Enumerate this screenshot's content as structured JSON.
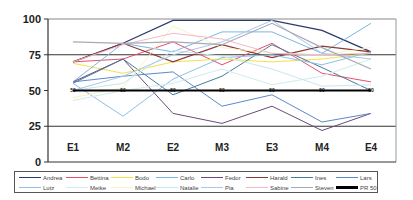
{
  "chart_data": {
    "type": "line",
    "title": "",
    "xlabel": "",
    "ylabel": "",
    "ylim": [
      0,
      100
    ],
    "yticks": [
      0,
      25,
      50,
      75,
      100
    ],
    "grid": {
      "horizontal_at": [
        25,
        75,
        100
      ],
      "vertical": false
    },
    "legend_position": "bottom",
    "categories": [
      "E1",
      "M2",
      "E2",
      "M3",
      "E3",
      "M4",
      "E4"
    ],
    "series": [
      {
        "name": "Andrea",
        "color": "#2b3a6b",
        "width": 1.2,
        "values": [
          70,
          83,
          99,
          99,
          99,
          92,
          77
        ]
      },
      {
        "name": "Bettina",
        "color": "#e8506a",
        "width": 1.0,
        "values": [
          70,
          72,
          84,
          68,
          83,
          62,
          56
        ]
      },
      {
        "name": "Bodo",
        "color": "#f2e24a",
        "width": 1.0,
        "values": [
          69,
          62,
          70,
          72,
          70,
          72,
          76
        ]
      },
      {
        "name": "Carlo",
        "color": "#7ab8e0",
        "width": 1.0,
        "values": [
          56,
          83,
          77,
          91,
          91,
          76,
          97
        ]
      },
      {
        "name": "Fedor",
        "color": "#6b4a7a",
        "width": 1.0,
        "values": [
          56,
          72,
          34,
          27,
          39,
          22,
          34
        ]
      },
      {
        "name": "Harald",
        "color": "#8a3a3a",
        "width": 1.2,
        "values": [
          70,
          83,
          70,
          82,
          73,
          81,
          77
        ]
      },
      {
        "name": "Ines",
        "color": "#4a7a9a",
        "width": 1.0,
        "values": [
          55,
          72,
          47,
          60,
          82,
          66,
          50
        ]
      },
      {
        "name": "Lars",
        "color": "#5b8ac8",
        "width": 1.0,
        "values": [
          56,
          60,
          63,
          39,
          47,
          28,
          34
        ]
      },
      {
        "name": "Lutz",
        "color": "#8fc0e8",
        "width": 1.0,
        "values": [
          55,
          32,
          58,
          73,
          75,
          68,
          77
        ]
      },
      {
        "name": "Meike",
        "color": "#d0ecf0",
        "width": 1.0,
        "values": [
          43,
          50,
          55,
          65,
          54,
          60,
          72
        ]
      },
      {
        "name": "Michael",
        "color": "#f7f2c0",
        "width": 1.0,
        "values": [
          45,
          52,
          95,
          80,
          76,
          75,
          80
        ]
      },
      {
        "name": "Natalie",
        "color": "#c8e8ec",
        "width": 1.0,
        "values": [
          50,
          55,
          78,
          74,
          65,
          53,
          54
        ]
      },
      {
        "name": "Pia",
        "color": "#a8c8e8",
        "width": 1.0,
        "values": [
          50,
          60,
          75,
          84,
          99,
          76,
          72
        ]
      },
      {
        "name": "Sabine",
        "color": "#f4b8c8",
        "width": 1.0,
        "values": [
          70,
          82,
          90,
          86,
          76,
          75,
          76
        ]
      },
      {
        "name": "Steven",
        "color": "#a8a8b8",
        "width": 1.2,
        "values": [
          84,
          83,
          84,
          82,
          97,
          80,
          65
        ]
      },
      {
        "name": "PR 50",
        "color": "#000000",
        "width": 2.2,
        "values": [
          50,
          50,
          50,
          50,
          50,
          50,
          50
        ],
        "point_labels": "50"
      }
    ]
  },
  "axis": {
    "y_labels": [
      "100",
      "75",
      "50",
      "25",
      "0"
    ],
    "x_labels": [
      "E1",
      "M2",
      "E2",
      "M3",
      "E3",
      "M4",
      "E4"
    ],
    "pr_point_label": "50"
  },
  "legend": {
    "rows": [
      [
        "Andrea",
        "Bettina",
        "Bodo",
        "Carlo",
        "Fedor",
        "Harald",
        "Ines",
        "Lars"
      ],
      [
        "Lutz",
        "Meike",
        "Michael",
        "Natalie",
        "Pia",
        "Sabine",
        "Steven",
        "PR 50"
      ]
    ]
  }
}
